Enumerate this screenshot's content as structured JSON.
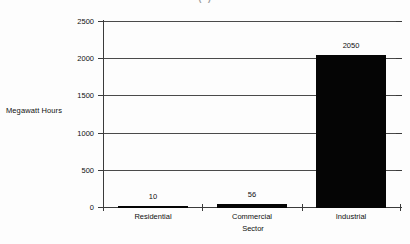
{
  "chart_data": {
    "type": "bar",
    "title": "(     )",
    "categories": [
      "Residential",
      "Commercial",
      "Industrial"
    ],
    "values": [
      10,
      56,
      2050
    ],
    "data_labels": [
      "10",
      "56",
      "2050"
    ],
    "xlabel": "Sector",
    "ylabel": "Megawatt Hours",
    "ylim": [
      0,
      2500
    ],
    "ytick_labels": [
      "0",
      "500",
      "1000",
      "1500",
      "2000",
      "2500"
    ],
    "ytick_values": [
      0,
      500,
      1000,
      1500,
      2000,
      2500
    ],
    "grid": true,
    "legend": false,
    "bar_color": "#050505",
    "axis_color": "#3b3b3b",
    "grid_color": "#4a4a4a",
    "background": "#fdfdfd"
  }
}
